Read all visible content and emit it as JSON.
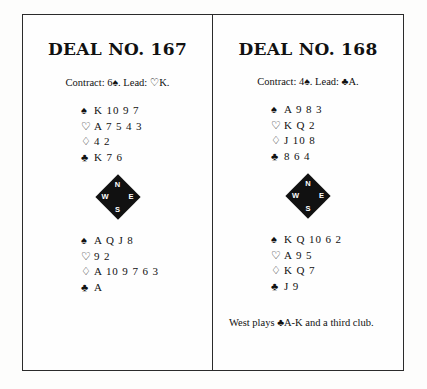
{
  "page": {
    "background_color": "#fdfdfc",
    "frame_color": "#2b2b2b",
    "text_color": "#111111"
  },
  "suits": {
    "spade": "♠",
    "heart": "♡",
    "diamond": "♢",
    "club": "♣"
  },
  "compass": {
    "north": "N",
    "south": "S",
    "west": "W",
    "east": "E",
    "fill_color": "#111111",
    "label_color": "#ffffff"
  },
  "deals": [
    {
      "title": "DEAL NO. 167",
      "contract_line": "Contract: 6♠. Lead: ♡K.",
      "contract": "6♠",
      "lead": "♡K",
      "north": {
        "spades_symbol": "♠",
        "spades": "K 10 9 7",
        "hearts_symbol": "♡",
        "hearts": "A 7 5 4 3",
        "diamonds_symbol": "♢",
        "diamonds": "4 2",
        "clubs_symbol": "♣",
        "clubs": "K 7 6"
      },
      "south": {
        "spades_symbol": "♠",
        "spades": "A Q J 8",
        "hearts_symbol": "♡",
        "hearts": "9 2",
        "diamonds_symbol": "♢",
        "diamonds": "A 10 9 7 6 3",
        "clubs_symbol": "♣",
        "clubs": "A"
      },
      "note": ""
    },
    {
      "title": "DEAL NO. 168",
      "contract_line": "Contract: 4♠. Lead: ♣A.",
      "contract": "4♠",
      "lead": "♣A",
      "north": {
        "spades_symbol": "♠",
        "spades": "A 9 8 3",
        "hearts_symbol": "♡",
        "hearts": "K Q 2",
        "diamonds_symbol": "♢",
        "diamonds": "J 10 8",
        "clubs_symbol": "♣",
        "clubs": "8 6 4"
      },
      "south": {
        "spades_symbol": "♠",
        "spades": "K Q 10 6 2",
        "hearts_symbol": "♡",
        "hearts": "A 9 5",
        "diamonds_symbol": "♢",
        "diamonds": "K Q 7",
        "clubs_symbol": "♣",
        "clubs": "J 9"
      },
      "note": "West plays ♣A-K and a third club."
    }
  ]
}
